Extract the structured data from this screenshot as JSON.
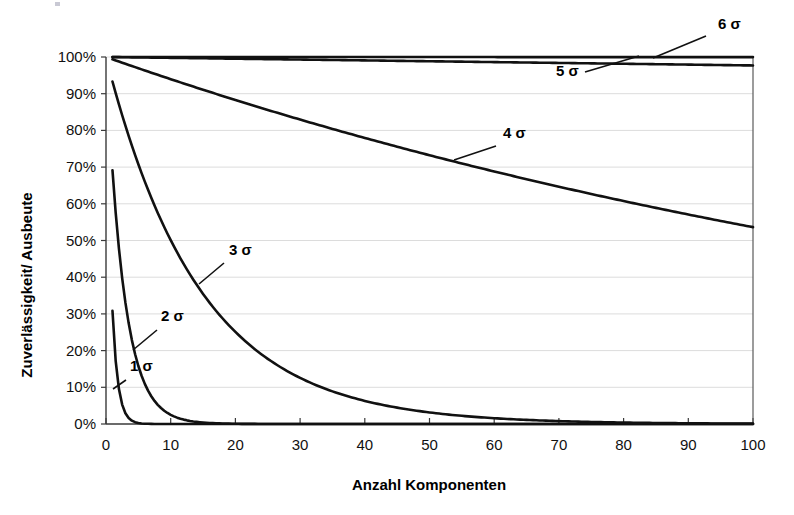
{
  "chart_data": {
    "type": "line",
    "title": "",
    "xlabel": "Anzahl Komponenten",
    "ylabel": "Zuverlässigkeit/ Ausbeute",
    "xlim": [
      0,
      100
    ],
    "ylim": [
      0,
      1.0
    ],
    "grid": true,
    "legend_position": "inline-annotations",
    "x_ticks": [
      "0",
      "10",
      "20",
      "30",
      "40",
      "50",
      "60",
      "70",
      "80",
      "90",
      "100"
    ],
    "x_tick_values": [
      0,
      10,
      20,
      30,
      40,
      50,
      60,
      70,
      80,
      90,
      100
    ],
    "y_ticks": [
      "0%",
      "10%",
      "20%",
      "30%",
      "40%",
      "50%",
      "60%",
      "70%",
      "80%",
      "90%",
      "100%"
    ],
    "y_tick_values": [
      0,
      0.1,
      0.2,
      0.3,
      0.4,
      0.5,
      0.6,
      0.7,
      0.8,
      0.9,
      1.0
    ],
    "x": [
      1,
      5,
      10,
      15,
      20,
      25,
      30,
      35,
      40,
      45,
      50,
      55,
      60,
      65,
      70,
      75,
      80,
      85,
      90,
      95,
      100
    ],
    "series": [
      {
        "name": "1 σ",
        "label": "1 σ",
        "per_component_yield": 0.3085,
        "values": [
          0.3085,
          0.0028,
          0.0,
          0.0,
          0.0,
          0.0,
          0.0,
          0.0,
          0.0,
          0.0,
          0.0,
          0.0,
          0.0,
          0.0,
          0.0,
          0.0,
          0.0,
          0.0,
          0.0,
          0.0,
          0.0
        ]
      },
      {
        "name": "2 σ",
        "label": "2 σ",
        "per_component_yield": 0.6915,
        "values": [
          0.6915,
          0.1581,
          0.025,
          0.004,
          0.0006,
          0.0001,
          0.0,
          0.0,
          0.0,
          0.0,
          0.0,
          0.0,
          0.0,
          0.0,
          0.0,
          0.0,
          0.0,
          0.0,
          0.0,
          0.0,
          0.0
        ]
      },
      {
        "name": "3 σ",
        "label": "3 σ",
        "per_component_yield": 0.9332,
        "values": [
          0.9332,
          0.7083,
          0.5017,
          0.3553,
          0.2517,
          0.1783,
          0.1263,
          0.0894,
          0.0633,
          0.0449,
          0.0318,
          0.0225,
          0.0159,
          0.0113,
          0.008,
          0.0057,
          0.004,
          0.0028,
          0.002,
          0.0014,
          0.001
        ]
      },
      {
        "name": "4 σ",
        "label": "4 σ",
        "per_component_yield": 0.99379,
        "values": [
          0.99379,
          0.96934,
          0.93963,
          0.91083,
          0.88291,
          0.85584,
          0.82961,
          0.80418,
          0.77953,
          0.75564,
          0.73248,
          0.71003,
          0.68827,
          0.66718,
          0.64673,
          0.62691,
          0.6077,
          0.58907,
          0.57102,
          0.55352,
          0.53655
        ]
      },
      {
        "name": "5 σ",
        "label": "5 σ",
        "per_component_yield": 0.999767,
        "values": [
          0.999767,
          0.998835,
          0.997671,
          0.996508,
          0.995347,
          0.994187,
          0.993029,
          0.991871,
          0.990716,
          0.989561,
          0.988408,
          0.987257,
          0.986106,
          0.984957,
          0.98381,
          0.982664,
          0.981519,
          0.980375,
          0.979233,
          0.978093,
          0.976953
        ]
      },
      {
        "name": "6 σ",
        "label": "6 σ",
        "per_component_yield": 0.9999966,
        "values": [
          0.9999966,
          0.999983,
          0.999966,
          0.999949,
          0.999932,
          0.999915,
          0.999898,
          0.999881,
          0.999864,
          0.999847,
          0.99983,
          0.999813,
          0.999796,
          0.999779,
          0.999762,
          0.999745,
          0.999728,
          0.999711,
          0.999694,
          0.999677,
          0.99966
        ]
      }
    ],
    "annotations": [
      {
        "label": "6 σ",
        "x_text": 718,
        "y_text": 29,
        "leader_from": [
          706,
          36
        ],
        "leader_to": [
          653,
          58
        ]
      },
      {
        "label": "5 σ",
        "x_text": 556,
        "y_text": 76,
        "leader_from": [
          585,
          72
        ],
        "leader_to": [
          639,
          56
        ]
      },
      {
        "label": "4 σ",
        "x_text": 503,
        "y_text": 138,
        "leader_from": [
          496,
          146
        ],
        "leader_to": [
          454,
          160
        ]
      },
      {
        "label": "3 σ",
        "x_text": 229,
        "y_text": 255,
        "leader_from": [
          224,
          263
        ],
        "leader_to": [
          199,
          284
        ]
      },
      {
        "label": "2 σ",
        "x_text": 161,
        "y_text": 321,
        "leader_from": [
          157,
          330
        ],
        "leader_to": [
          133,
          350
        ]
      },
      {
        "label": "1 σ",
        "x_text": 130,
        "y_text": 371,
        "leader_from": [
          126,
          380
        ],
        "leader_to": [
          113,
          389
        ]
      }
    ]
  }
}
